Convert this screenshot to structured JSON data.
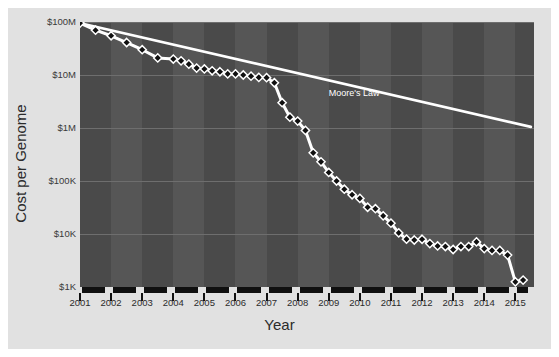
{
  "chart_data": {
    "type": "line",
    "title": "",
    "xlabel": "Year",
    "ylabel": "Cost per Genome",
    "xlim": [
      2001,
      2015.6
    ],
    "ylim": [
      1000,
      100000000
    ],
    "yscale": "log",
    "grid": true,
    "legend": "none",
    "ytick_labels": [
      "$100M",
      "$10M",
      "$1M",
      "$100K",
      "$10K",
      "$1K"
    ],
    "ytick_values": [
      100000000,
      10000000,
      1000000,
      100000,
      10000,
      1000
    ],
    "xtick_labels": [
      "2001",
      "2002",
      "2003",
      "2004",
      "2005",
      "2006",
      "2007",
      "2008",
      "2009",
      "2010",
      "2011",
      "2012",
      "2013",
      "2014",
      "2015"
    ],
    "xtick_values": [
      2001,
      2002,
      2003,
      2004,
      2005,
      2006,
      2007,
      2008,
      2009,
      2010,
      2011,
      2012,
      2013,
      2014,
      2015
    ],
    "annotations": [
      {
        "text": "Moore's Law",
        "x": 2009.0,
        "y": 4300000,
        "color": "#ffffff"
      }
    ],
    "series": [
      {
        "name": "Moore's Law",
        "style": "line",
        "color": "#ffffff",
        "x": [
          2001.0,
          2015.5
        ],
        "values": [
          95000000,
          1050000
        ]
      },
      {
        "name": "Cost per Genome",
        "style": "line-marker",
        "marker": "diamond",
        "marker_fill": "#101010",
        "marker_edge": "#ffffff",
        "color": "#ffffff",
        "x": [
          2001.0,
          2001.5,
          2002.0,
          2002.5,
          2003.0,
          2003.5,
          2004.0,
          2004.25,
          2004.5,
          2004.75,
          2005.0,
          2005.25,
          2005.5,
          2005.75,
          2006.0,
          2006.25,
          2006.5,
          2006.75,
          2007.0,
          2007.25,
          2007.5,
          2007.75,
          2008.0,
          2008.25,
          2008.5,
          2008.75,
          2009.0,
          2009.25,
          2009.5,
          2009.75,
          2010.0,
          2010.25,
          2010.5,
          2010.75,
          2011.0,
          2011.25,
          2011.5,
          2011.75,
          2012.0,
          2012.25,
          2012.5,
          2012.75,
          2013.0,
          2013.25,
          2013.5,
          2013.75,
          2014.0,
          2014.25,
          2014.5,
          2014.75,
          2015.0,
          2015.25
        ],
        "values": [
          95300000,
          70000000,
          55000000,
          41000000,
          30000000,
          21000000,
          20000000,
          18500000,
          16000000,
          13500000,
          13000000,
          12000000,
          11500000,
          10500000,
          10500000,
          10000000,
          9500000,
          9000000,
          8900000,
          7150000,
          3000000,
          1600000,
          1350000,
          900000,
          340000,
          230000,
          145000,
          100000,
          70000,
          55000,
          47000,
          32000,
          30000,
          22000,
          16000,
          10500,
          8000,
          7700,
          7950,
          6600,
          5950,
          5800,
          5100,
          5800,
          5800,
          7100,
          5300,
          4900,
          4900,
          4000,
          1250,
          1350
        ]
      }
    ]
  },
  "axis": {
    "y_title": "Cost per Genome",
    "x_title": "Year"
  },
  "colors": {
    "panel_bg": "#e1e1e1",
    "plot_bg": "#565656",
    "band": "#4a4a4a",
    "gridline": "#6e6e6e",
    "axis": "#101010",
    "line": "#ffffff",
    "marker_fill": "#101010",
    "text": "#2b2b2b"
  }
}
